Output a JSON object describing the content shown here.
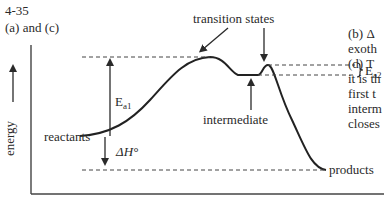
{
  "problem": {
    "number": "4-35",
    "parts": "(a) and (c)"
  },
  "diagram": {
    "y_axis_label": "energy",
    "labels": {
      "transition_states": "transition states",
      "intermediate": "intermediate",
      "reactants": "reactants",
      "products": "products",
      "ea1_main": "E",
      "ea1_sub": "a1",
      "ea2_main": "E",
      "ea2_sub": "a2",
      "delta_h": "ΔH°"
    }
  },
  "side_text": {
    "lines": [
      "(b)  Δ",
      "exoth",
      "(d)  T",
      "it is th",
      "first t",
      "interm",
      "closes"
    ]
  }
}
